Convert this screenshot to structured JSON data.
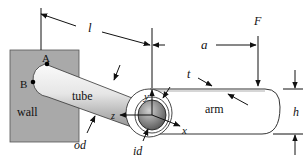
{
  "diagram": {
    "type": "engineering-schematic",
    "colors": {
      "wall": "#a9a9a9",
      "tube_light": "#f2f2f2",
      "tube_dark": "#9a9a9a",
      "arm": "#ffffff",
      "line": "#111111"
    },
    "labels": {
      "wall": "wall",
      "tube": "tube",
      "arm": "arm",
      "point_a": "A",
      "point_b": "B",
      "length": "l",
      "arm_offset": "a",
      "force": "F",
      "thickness": "t",
      "height": "h",
      "outer_diameter": "od",
      "inner_diameter": "id",
      "axis_x": "x",
      "axis_y": "y",
      "axis_z": "z"
    }
  }
}
